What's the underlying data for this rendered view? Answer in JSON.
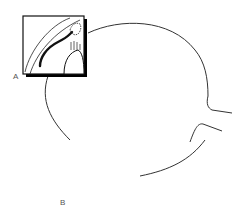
{
  "diagram": {
    "labels": {
      "inset_a": "A",
      "inset_b": "B"
    },
    "colors": {
      "stroke": "#1a1a1a",
      "shadow": "#000000",
      "label": "#555555",
      "background": "#ffffff"
    },
    "elements": [
      {
        "id": "globe-outline",
        "description": "circular outline of the eyeball"
      },
      {
        "id": "optic-nerve",
        "description": "optic nerve stub extending to the right"
      },
      {
        "id": "inset-a",
        "description": "magnified view box A (upper left)"
      },
      {
        "id": "inset-b",
        "description": "magnified view box B (lower middle)"
      }
    ]
  }
}
